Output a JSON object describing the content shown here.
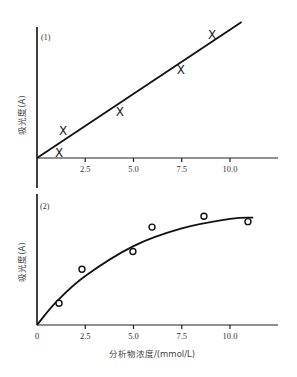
{
  "chart_data": [
    {
      "type": "scatter",
      "panel_label": "(1)",
      "title": "",
      "xlabel": "",
      "ylabel": "吸光度(A)",
      "xlim": [
        0,
        12.5
      ],
      "ylim": [
        0,
        1.0
      ],
      "x_ticks": [
        2.5,
        5.0,
        7.5,
        10.0
      ],
      "x_tick_labels": [
        "2.5",
        "5.0",
        "7.5",
        "10.0"
      ],
      "y_ticks": [],
      "grid": false,
      "legend": null,
      "marker": "x",
      "series": [
        {
          "name": "measured",
          "x": [
            1.14,
            1.35,
            4.3,
            7.46,
            9.07
          ],
          "y": [
            0.04,
            0.2,
            0.34,
            0.65,
            0.91
          ]
        }
      ],
      "fit": {
        "type": "linear",
        "x": [
          0,
          10.6
        ],
        "y": [
          0,
          1.0
        ]
      }
    },
    {
      "type": "scatter",
      "panel_label": "(2)",
      "title": "",
      "xlabel": "分析物浓度/(mmol/L)",
      "ylabel": "吸光度(A)",
      "xlim": [
        0,
        12.5
      ],
      "ylim": [
        0,
        1.0
      ],
      "x_ticks": [
        0,
        2.5,
        5.0,
        7.5,
        10.0
      ],
      "x_tick_labels": [
        "0",
        "2.5",
        "5.0",
        "7.5",
        "10.0"
      ],
      "y_ticks": [],
      "grid": false,
      "legend": null,
      "marker": "o",
      "series": [
        {
          "name": "measured",
          "x": [
            1.14,
            2.33,
            4.97,
            5.96,
            8.65,
            10.93
          ],
          "y": [
            0.16,
            0.41,
            0.54,
            0.72,
            0.8,
            0.76
          ]
        }
      ],
      "fit": {
        "type": "curve (saturating)",
        "x": [
          0,
          1,
          2.5,
          5,
          7.5,
          10,
          11.2
        ],
        "y": [
          0,
          0.17,
          0.36,
          0.58,
          0.71,
          0.78,
          0.79
        ]
      }
    }
  ]
}
